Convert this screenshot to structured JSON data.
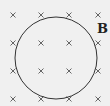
{
  "diagram": {
    "field_label": "B",
    "field_symbol": "×",
    "field_grid": {
      "columns": [
        13,
        41,
        69,
        98
      ],
      "rows": [
        15,
        43,
        71,
        99
      ]
    },
    "circle": {
      "cx": 56,
      "cy": 58,
      "r": 41
    },
    "colors": {
      "background": "#f0f0f0",
      "stroke": "#333333",
      "cross": "#555555"
    }
  }
}
